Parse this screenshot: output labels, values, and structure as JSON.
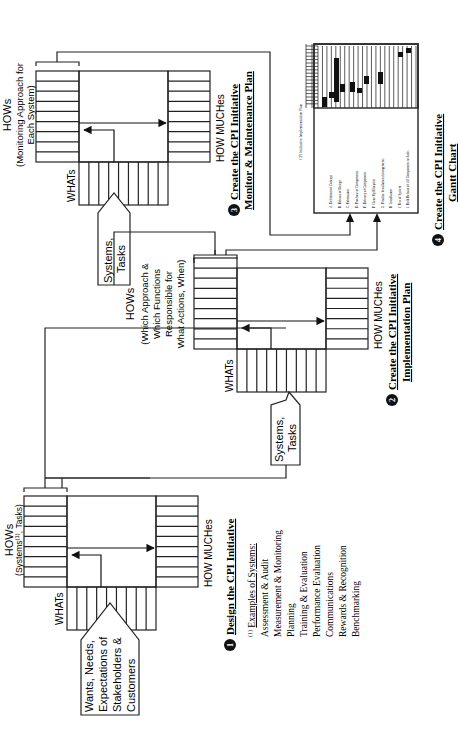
{
  "orientation": "rotated-90-ccw",
  "stage1": {
    "hows_title": "HOWs",
    "hows_sub": "(Systems(1), Tasks)",
    "hows_sub_pre": "(Systems",
    "hows_sub_sup": "(1)",
    "hows_sub_post": ", Tasks)",
    "whats_label": "WHATs",
    "how_muches_label": "HOW MUCHes",
    "input_lines": [
      "Wants, Needs,",
      "Expectations of",
      "Stakeholders &",
      "Customers"
    ],
    "step_number": "1",
    "step_title": "Design the CPI Initiative",
    "footnote_marker": "(1)",
    "examples_title": "Examples of Systems:",
    "examples": [
      "Assessment & Audit",
      "Measurement & Monitoring",
      "Planning",
      "Training & Evaluation",
      "Performance Evaluation",
      "Communications",
      "Rewards & Recognition",
      "Benchmarking"
    ]
  },
  "stage2": {
    "hows_title": "HOWs",
    "hows_sub_lines": [
      "(Which Approach &",
      "Which Functions",
      "Responsible for",
      "What Actions, When)"
    ],
    "whats_label": "WHATs",
    "how_muches_label": "HOW MUCHes",
    "input_lines": [
      "Systems,",
      "Tasks"
    ],
    "step_number": "2",
    "step_title_lines": [
      "Create the CPI Initiative",
      "Implementation Plan"
    ]
  },
  "stage3": {
    "hows_title": "HOWs",
    "hows_sub_lines": [
      "(Monitoring Approach for",
      "Each System)"
    ],
    "whats_label": "WHATs",
    "how_muches_label": "HOW MUCHes",
    "input_lines": [
      "Systems,",
      "Tasks"
    ],
    "step_number": "3",
    "step_title_lines": [
      "Create the CPI Initiative",
      "Monitor & Maintenance Plan"
    ]
  },
  "stage4": {
    "chart_title": "CPI Initiative Implementation Plan",
    "tasks": [
      "A. Definition of Concept",
      "B. Release of Design",
      "C. Fabrication",
      "D. Purchase of Components",
      "E. Delivery of Components",
      "F. Clean Up Blueprint",
      "G. Finalize Installation Arrangements",
      "H. Installation",
      "I. Test of System",
      "J. Bulk Release of All Components to Sales"
    ],
    "step_number": "4",
    "step_title_lines": [
      "Create the CPI Initiative",
      "Gantt Chart"
    ]
  }
}
